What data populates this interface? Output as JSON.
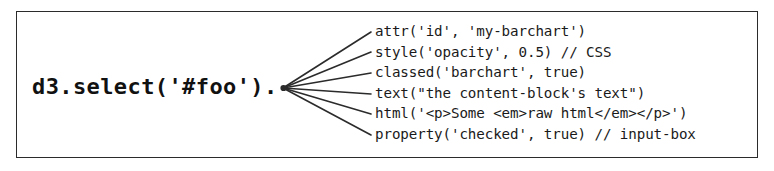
{
  "figure": {
    "name": "d3-selection-methods-diagram",
    "frame_color": "#2b2b2b",
    "background_color": "#ffffff",
    "text_color": "#1a1a1a",
    "root_call": "d3.select('#foo').",
    "methods": [
      {
        "label": "attr('id', 'my-barchart')"
      },
      {
        "label": "style('opacity', 0.5) // CSS"
      },
      {
        "label": "classed('barchart', true)"
      },
      {
        "label": "text(\"the content-block's text\")"
      },
      {
        "label": "html('<p>Some <em>raw html</em></p>')"
      },
      {
        "label": "property('checked', true) // input-box"
      }
    ]
  }
}
